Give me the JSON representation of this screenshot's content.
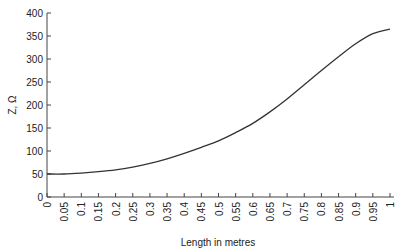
{
  "chart_data": {
    "type": "line",
    "title": "",
    "xlabel": "Length in metres",
    "ylabel": "Z, Ω",
    "xlim": [
      0,
      1
    ],
    "ylim": [
      0,
      400
    ],
    "grid": false,
    "legend": null,
    "x_ticks": [
      "0",
      "0.05",
      "0.1",
      "0.15",
      "0.2",
      "0.25",
      "0.3",
      "0.35",
      "0.4",
      "0.45",
      "0.5",
      "0.55",
      "0.6",
      "0.65",
      "0.7",
      "0.75",
      "0.8",
      "0.85",
      "0.9",
      "0.95",
      "1"
    ],
    "y_ticks": [
      "0",
      "50",
      "100",
      "150",
      "200",
      "250",
      "300",
      "350",
      "400"
    ],
    "series": [
      {
        "name": "Z",
        "color": "#333333",
        "x": [
          0,
          0.05,
          0.1,
          0.15,
          0.2,
          0.25,
          0.3,
          0.35,
          0.4,
          0.45,
          0.5,
          0.55,
          0.6,
          0.65,
          0.7,
          0.75,
          0.8,
          0.85,
          0.9,
          0.95,
          1.0
        ],
        "values": [
          50,
          50,
          52,
          55,
          59,
          65,
          73,
          83,
          95,
          108,
          122,
          140,
          160,
          185,
          213,
          244,
          275,
          305,
          333,
          355,
          365
        ]
      }
    ]
  }
}
